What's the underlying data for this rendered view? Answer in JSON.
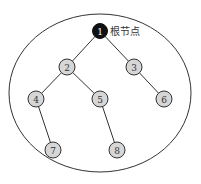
{
  "diagram": {
    "type": "binary-tree",
    "colors": {
      "root_fill": "#111111",
      "node_fill": "#d6d6d6",
      "stroke": "#333333",
      "root_text": "#ffffff",
      "node_text": "#333333"
    },
    "boundary": {
      "cx": 100,
      "cy": 93,
      "rx": 91,
      "ry": 79
    },
    "root_label": "根节点",
    "nodes": [
      {
        "id": "1",
        "label": "1",
        "x": 100,
        "y": 31,
        "root": true
      },
      {
        "id": "2",
        "label": "2",
        "x": 67,
        "y": 67
      },
      {
        "id": "3",
        "label": "3",
        "x": 134,
        "y": 67
      },
      {
        "id": "4",
        "label": "4",
        "x": 36,
        "y": 99
      },
      {
        "id": "5",
        "label": "5",
        "x": 100,
        "y": 99
      },
      {
        "id": "6",
        "label": "6",
        "x": 164,
        "y": 99
      },
      {
        "id": "7",
        "label": "7",
        "x": 53,
        "y": 150
      },
      {
        "id": "8",
        "label": "8",
        "x": 117,
        "y": 150
      }
    ],
    "edges": [
      [
        "1",
        "2"
      ],
      [
        "1",
        "3"
      ],
      [
        "2",
        "4"
      ],
      [
        "2",
        "5"
      ],
      [
        "3",
        "6"
      ],
      [
        "4",
        "7"
      ],
      [
        "5",
        "8"
      ]
    ]
  }
}
